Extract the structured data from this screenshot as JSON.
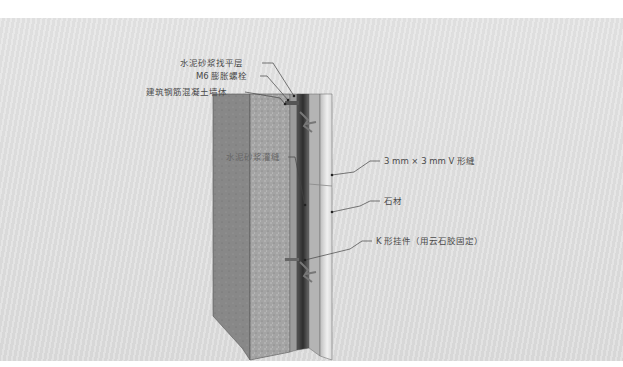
{
  "diagram": {
    "type": "stone-cladding-wall-section",
    "labels": {
      "mortar_leveling": "水泥砂浆找平层",
      "expansion_bolt": "M6 膨胀螺栓",
      "concrete_wall": "建筑钢筋混凝土墙体",
      "grout_fill": "水泥砂浆灌缝",
      "v_joint": "3 mm × 3 mm V 形缝",
      "stone": "石材",
      "k_hanger": "K 形挂件（用云石胶固定）"
    },
    "colors": {
      "background_panel": "#dedede",
      "wall_side": "#8a8a8a",
      "wall_front": "#a9a9a9",
      "mortar": "#9a9a9a",
      "cavity": "#3a3a3a",
      "stone": "#d4d4d4",
      "leader_line": "#444444"
    }
  }
}
